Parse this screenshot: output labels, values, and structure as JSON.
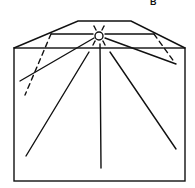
{
  "figure": {
    "panel_label": "B",
    "stroke_color": "#111111",
    "background": "#ffffff",
    "elements": {
      "light_source": {
        "shape": "circle",
        "center": [
          99,
          36
        ],
        "radius": 4
      },
      "roof_trapezoid": {
        "top": [
          [
            78,
            21
          ],
          [
            131,
            21
          ]
        ],
        "bottom": [
          [
            14,
            48
          ],
          [
            185,
            48
          ]
        ]
      },
      "inner_horizontal_line": {
        "from": [
          51,
          34
        ],
        "to": [
          154,
          34
        ]
      },
      "box": {
        "x": 14,
        "y": 48,
        "width": 171,
        "height": 133
      },
      "rays": [
        {
          "to": [
            20,
            81
          ]
        },
        {
          "to": [
            26,
            156
          ]
        },
        {
          "to": [
            101,
            168
          ]
        },
        {
          "to": [
            176,
            149
          ]
        },
        {
          "to": [
            176,
            64
          ]
        }
      ],
      "dashed_lines": [
        {
          "from": [
            51,
            34
          ],
          "to": [
            25,
            95
          ]
        },
        {
          "from": [
            154,
            34
          ],
          "to": [
            175,
            63
          ]
        }
      ]
    }
  }
}
